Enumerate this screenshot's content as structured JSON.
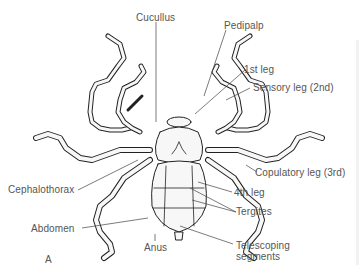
{
  "diagram": {
    "panel_letter": "A",
    "labels": {
      "cucullus": "Cucullus",
      "pedipalp": "Pedipalp",
      "first_leg": "1st leg",
      "sensory_leg": "Sensory leg (2nd)",
      "copulatory_leg": "Copulatory leg (3rd)",
      "cephalothorax": "Cephalothorax",
      "fourth_leg": "4th leg",
      "tergites": "Tergites",
      "abdomen": "Abdomen",
      "anus": "Anus",
      "telescoping_1": "Telescoping",
      "telescoping_2": "segments"
    },
    "colors": {
      "ink": "#222222",
      "label_text": "#555555",
      "leader_line": "#444444",
      "background": "#ffffff"
    }
  }
}
